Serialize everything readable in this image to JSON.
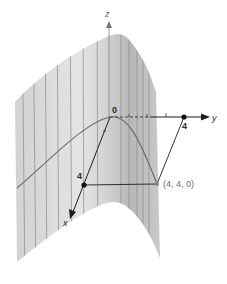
{
  "figure": {
    "colors": {
      "surface_light": "#e6e6e6",
      "surface_dark": "#b9b9b9",
      "ruling_lines": "#8a8a8a",
      "curve": "#6a6a6a",
      "axes": "#1e1e1e",
      "point": "#111111",
      "background": "#ffffff"
    },
    "axes": {
      "x_label": "x",
      "y_label": "y",
      "z_label": "z"
    },
    "labels": {
      "origin": "0",
      "x_point": "4",
      "y_point": "4",
      "corner_point": "(4, 4, 0)"
    }
  }
}
